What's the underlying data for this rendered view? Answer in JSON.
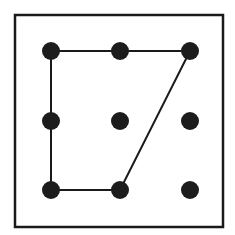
{
  "diagram": {
    "frame": {
      "x": 15,
      "y": 15,
      "width": 208,
      "height": 212
    },
    "colors": {
      "stroke": "#1a1a1a",
      "dot": "#1c1c1c",
      "background": "#ffffff"
    },
    "grid": {
      "columns": [
        51,
        120,
        190
      ],
      "rows": [
        51,
        121,
        190
      ],
      "dot_radius": 9
    },
    "dots": [
      {
        "id": "r1c1",
        "x": 51,
        "y": 51
      },
      {
        "id": "r1c2",
        "x": 120,
        "y": 51
      },
      {
        "id": "r1c3",
        "x": 190,
        "y": 51
      },
      {
        "id": "r2c1",
        "x": 51,
        "y": 121
      },
      {
        "id": "r2c2",
        "x": 120,
        "y": 121
      },
      {
        "id": "r2c3",
        "x": 190,
        "y": 121
      },
      {
        "id": "r3c1",
        "x": 51,
        "y": 190
      },
      {
        "id": "r3c2",
        "x": 120,
        "y": 190
      },
      {
        "id": "r3c3",
        "x": 190,
        "y": 190
      }
    ],
    "path": {
      "closed": true,
      "vertices": [
        "r1c1",
        "r1c2",
        "r1c3",
        "r3c2",
        "r3c1",
        "r2c1"
      ],
      "points": "51,51 120,51 190,51 120,190 51,190 51,121"
    }
  }
}
